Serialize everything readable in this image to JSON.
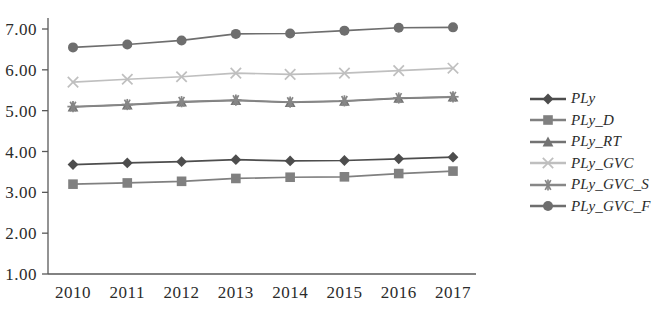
{
  "chart_data": {
    "type": "line",
    "title": "",
    "subtitle": "",
    "xlabel": "",
    "ylabel": "",
    "categories": [
      "2010",
      "2011",
      "2012",
      "2013",
      "2014",
      "2015",
      "2016",
      "2017"
    ],
    "ylim": [
      1.0,
      7.0
    ],
    "ytick_labels": [
      "1.00",
      "2.00",
      "3.00",
      "4.00",
      "5.00",
      "6.00",
      "7.00"
    ],
    "ytick_values": [
      1.0,
      2.0,
      3.0,
      4.0,
      5.0,
      6.0,
      7.0
    ],
    "grid": false,
    "legend_position": "right",
    "series": [
      {
        "name": "PLy",
        "marker": "diamond",
        "color": "#4d4d4d",
        "values": [
          3.68,
          3.72,
          3.75,
          3.8,
          3.77,
          3.78,
          3.82,
          3.86
        ]
      },
      {
        "name": "PLy_D",
        "marker": "square",
        "color": "#808080",
        "values": [
          3.2,
          3.23,
          3.27,
          3.34,
          3.37,
          3.38,
          3.46,
          3.52
        ]
      },
      {
        "name": "PLy_RT",
        "marker": "triangle",
        "color": "#737373",
        "values": [
          5.09,
          5.14,
          5.21,
          5.25,
          5.2,
          5.23,
          5.3,
          5.33
        ]
      },
      {
        "name": "PLy_GVC",
        "marker": "cross",
        "color": "#bfbfbf",
        "values": [
          5.7,
          5.77,
          5.83,
          5.92,
          5.89,
          5.92,
          5.98,
          6.04
        ]
      },
      {
        "name": "PLy_GVC_S",
        "marker": "asterisk",
        "color": "#878787",
        "values": [
          5.1,
          5.15,
          5.22,
          5.26,
          5.21,
          5.24,
          5.31,
          5.34
        ]
      },
      {
        "name": "PLy_GVC_F",
        "marker": "circle",
        "color": "#6e6e6e",
        "values": [
          6.55,
          6.62,
          6.72,
          6.88,
          6.89,
          6.96,
          7.03,
          7.04
        ]
      }
    ]
  },
  "axis": {
    "line_color": "#595959"
  }
}
